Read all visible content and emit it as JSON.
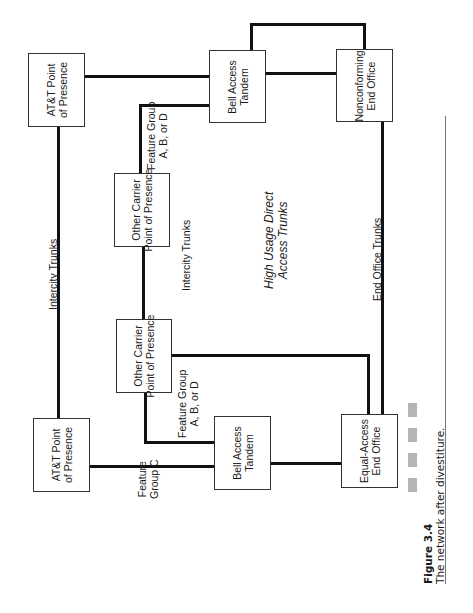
{
  "figure": {
    "number": "Figure 3.4",
    "caption": "The network after divestiture."
  },
  "nodes": {
    "att_pop_top": {
      "line1": "AT&T Point",
      "line2": "of Presence"
    },
    "bell_tandem_top": {
      "line1": "Bell Access",
      "line2": "Tandem"
    },
    "nonconforming_eo": {
      "line1": "Nonconforming",
      "line2": "End Office"
    },
    "other_carrier_top": {
      "line1": "Other Carrier",
      "line2": "Point of Presence"
    },
    "other_carrier_bottom": {
      "line1": "Other Carrier",
      "line2": "Point of Presence"
    },
    "att_pop_bottom": {
      "line1": "AT&T Point",
      "line2": "of Presence"
    },
    "bell_tandem_bottom": {
      "line1": "Bell Access",
      "line2": "Tandem"
    },
    "equal_access_eo": {
      "line1": "Equal-Access",
      "line2": "End Office"
    }
  },
  "edge_labels": {
    "intercity_left": "Intercity Trunks",
    "intercity_center": "Intercity Trunks",
    "fg_abd_top": {
      "line1": "Feature Group",
      "line2": "A, B, or D"
    },
    "fg_abd_bottom": {
      "line1": "Feature Group",
      "line2": "A, B, or D"
    },
    "fg_c": {
      "line1": "Feature",
      "line2": "Group C"
    },
    "end_office_trunks": "End Office Trunks",
    "high_usage": {
      "line1": "High Usage Direct",
      "line2": "Access Trunks"
    }
  },
  "colors": {
    "line": "#111111",
    "box_border": "#333333",
    "caption_bar": "#b5b5b5",
    "rule": "#777777"
  }
}
